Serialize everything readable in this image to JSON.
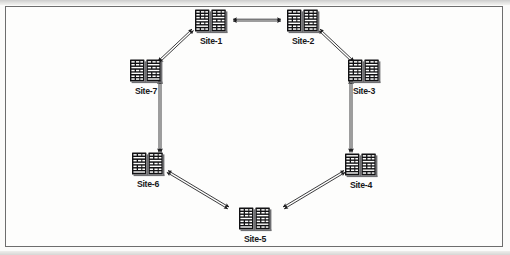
{
  "figure": {
    "type": "network-ring-topology-diagram",
    "title": "",
    "background_color": "#fdfdfc",
    "border_color": "#6d6d6d",
    "ink_color": "#1a1a1c",
    "node_icon_name": "server-rack-pair-icon",
    "connector_style": "double-line double-headed arrow"
  },
  "nodes": [
    {
      "id": "site-1",
      "label": "Site-1",
      "x": 211,
      "y": 12
    },
    {
      "id": "site-2",
      "label": "Site-2",
      "x": 303,
      "y": 12
    },
    {
      "id": "site-3",
      "label": "Site-3",
      "x": 364,
      "y": 62
    },
    {
      "id": "site-4",
      "label": "Site-4",
      "x": 361,
      "y": 156
    },
    {
      "id": "site-5",
      "label": "Site-5",
      "x": 255,
      "y": 210
    },
    {
      "id": "site-6",
      "label": "Site-6",
      "x": 148,
      "y": 155
    },
    {
      "id": "site-7",
      "label": "Site-7",
      "x": 146,
      "y": 62
    }
  ],
  "links": [
    {
      "id": "link-1-2",
      "from": "Site-1",
      "to": "Site-2",
      "arrow": "both"
    },
    {
      "id": "link-2-3",
      "from": "Site-2",
      "to": "Site-3",
      "arrow": "both"
    },
    {
      "id": "link-3-4",
      "from": "Site-3",
      "to": "Site-4",
      "arrow": "both"
    },
    {
      "id": "link-4-5",
      "from": "Site-4",
      "to": "Site-5",
      "arrow": "both"
    },
    {
      "id": "link-5-6",
      "from": "Site-5",
      "to": "Site-6",
      "arrow": "both"
    },
    {
      "id": "link-6-7",
      "from": "Site-6",
      "to": "Site-7",
      "arrow": "both"
    },
    {
      "id": "link-7-1",
      "from": "Site-7",
      "to": "Site-1",
      "arrow": "both"
    }
  ]
}
